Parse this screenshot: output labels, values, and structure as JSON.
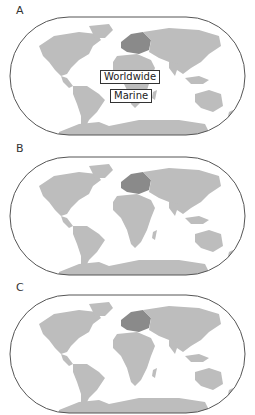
{
  "panels": [
    {
      "label": "A",
      "annotations": [
        "Worldwide",
        "Marine"
      ]
    },
    {
      "label": "B",
      "annotations": []
    },
    {
      "label": "C",
      "annotations": []
    }
  ],
  "colors": {
    "land": "#bdbdbd",
    "land_highlight": "#8a8a8a",
    "outline": "#555555",
    "ocean": "#ffffff"
  }
}
